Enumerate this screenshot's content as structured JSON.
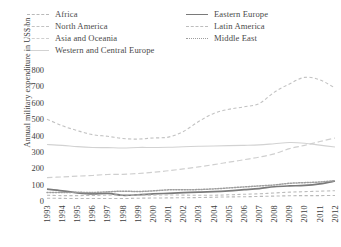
{
  "chart_data": {
    "type": "line",
    "title": "",
    "xlabel": "",
    "ylabel": "Annual military expenditure in US$ bn",
    "xlim": [
      1993,
      2012
    ],
    "ylim": [
      0,
      800
    ],
    "grid": false,
    "legend_position": "top",
    "yticks": [
      "800",
      "700",
      "600",
      "500",
      "400",
      "300",
      "200",
      "100",
      "0"
    ],
    "ytick_values": [
      800,
      700,
      600,
      500,
      400,
      300,
      200,
      100,
      0
    ],
    "x": [
      1993,
      1994,
      1995,
      1996,
      1997,
      1998,
      1999,
      2000,
      2001,
      2002,
      2003,
      2004,
      2005,
      2006,
      2007,
      2008,
      2009,
      2010,
      2011,
      2012
    ],
    "xticks": [
      "1993",
      "1994",
      "1995",
      "1996",
      "1997",
      "1998",
      "1999",
      "2000",
      "2001",
      "2002",
      "2003",
      "2004",
      "2005",
      "2006",
      "2007",
      "2008",
      "2009",
      "2010",
      "2011",
      "2012"
    ],
    "series": [
      {
        "name": "Africa",
        "style": "dashed",
        "color": "#b9b9b9",
        "values": [
          17,
          16,
          15,
          15,
          15,
          15,
          17,
          18,
          19,
          20,
          21,
          23,
          25,
          26,
          28,
          30,
          32,
          33,
          33,
          34
        ]
      },
      {
        "name": "North America",
        "style": "dashed",
        "color": "#c2c2c2",
        "values": [
          500,
          460,
          430,
          405,
          395,
          382,
          378,
          385,
          390,
          425,
          485,
          535,
          560,
          575,
          595,
          665,
          715,
          755,
          740,
          690
        ]
      },
      {
        "name": "Asia and Oceania",
        "style": "dash-long",
        "color": "#cfcfcf",
        "values": [
          143,
          147,
          152,
          156,
          162,
          163,
          168,
          175,
          185,
          196,
          208,
          222,
          237,
          252,
          268,
          288,
          320,
          340,
          363,
          385
        ]
      },
      {
        "name": "Western and Central Europe",
        "style": "solid-light",
        "color": "#d2d2d2",
        "values": [
          345,
          340,
          332,
          327,
          326,
          324,
          327,
          327,
          328,
          331,
          334,
          336,
          338,
          340,
          343,
          350,
          357,
          353,
          341,
          330
        ]
      },
      {
        "name": "Eastern Europe",
        "style": "solid-dark",
        "color": "#7a7a7a",
        "values": [
          72,
          62,
          50,
          43,
          46,
          35,
          38,
          43,
          47,
          51,
          54,
          57,
          62,
          69,
          76,
          87,
          92,
          95,
          105,
          122
        ]
      },
      {
        "name": "Latin America",
        "style": "dashed",
        "color": "#bdbdbd",
        "values": [
          35,
          33,
          33,
          34,
          36,
          37,
          36,
          36,
          37,
          36,
          35,
          35,
          38,
          41,
          44,
          49,
          54,
          57,
          60,
          63
        ]
      },
      {
        "name": "Middle East",
        "style": "dotted",
        "color": "#9e9e9e",
        "values": [
          52,
          52,
          53,
          52,
          56,
          60,
          58,
          62,
          68,
          68,
          70,
          74,
          80,
          86,
          92,
          98,
          108,
          112,
          116,
          124
        ]
      }
    ]
  },
  "legend": {
    "left_column": [
      {
        "label": "Africa",
        "swatch": "sw-dash-long"
      },
      {
        "label": "North America",
        "swatch": "sw-dash-med"
      },
      {
        "label": "Asia and Oceania",
        "swatch": "sw-dash-dot"
      },
      {
        "label": "Western and Central Europe",
        "swatch": "sw-solid-light"
      }
    ],
    "right_column": [
      {
        "label": "Eastern Europe",
        "swatch": "sw-solid-dark"
      },
      {
        "label": "Latin America",
        "swatch": "sw-dash-lat"
      },
      {
        "label": "Middle East",
        "swatch": "sw-dot"
      }
    ]
  }
}
